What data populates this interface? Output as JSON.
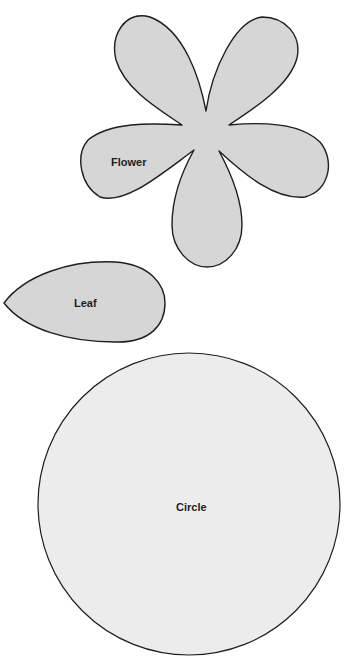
{
  "colors": {
    "background": "#ffffff",
    "shape_fill": "#d6d6d6",
    "circle_fill": "#ececec",
    "stroke": "#1e1e1e"
  },
  "shapes": [
    {
      "name": "flower",
      "label": "Flower"
    },
    {
      "name": "leaf",
      "label": "Leaf"
    },
    {
      "name": "circle",
      "label": "Circle"
    }
  ]
}
